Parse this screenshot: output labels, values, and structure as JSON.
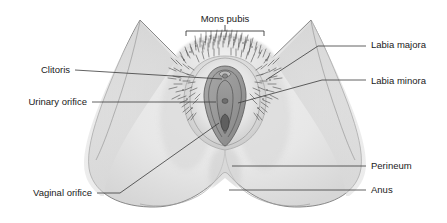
{
  "figure": {
    "background_color": "#ffffff",
    "line_color": "#3a3a3a",
    "body_fill": "#e8e8e8",
    "body_shadow": "#d2d2d2",
    "labia_majora_fill": "#dcdcdc",
    "labia_minora_fill": "#9a9a9a",
    "vestibule_fill": "#8c8c8c",
    "hair_color": "#4a4a4a"
  },
  "labels": {
    "mons_pubis": {
      "text": "Mons pubis",
      "x": 225,
      "y": 22,
      "anchor": "middle",
      "side": "top"
    },
    "labia_majora": {
      "text": "Labia majora",
      "x": 371,
      "y": 48,
      "anchor": "start",
      "side": "right"
    },
    "labia_minora": {
      "text": "Labia minora",
      "x": 371,
      "y": 82,
      "anchor": "start",
      "side": "right"
    },
    "perineum": {
      "text": "Perineum",
      "x": 371,
      "y": 168,
      "anchor": "start",
      "side": "right"
    },
    "anus": {
      "text": "Anus",
      "x": 371,
      "y": 192,
      "anchor": "start",
      "side": "right"
    },
    "clitoris": {
      "text": "Clitoris",
      "x": 70,
      "y": 72,
      "anchor": "end",
      "side": "left"
    },
    "urinary_orifice": {
      "text": "Urinary orifice",
      "x": 87,
      "y": 104,
      "anchor": "end",
      "side": "left"
    },
    "vaginal_orifice": {
      "text": "Vaginal orifice",
      "x": 92,
      "y": 195,
      "anchor": "end",
      "side": "left"
    }
  },
  "bracket": {
    "left_x": 186,
    "right_x": 264,
    "y": 31,
    "tick_x": 225,
    "tick_top": 25,
    "arm_drop": 5
  },
  "leaders": [
    {
      "name": "labia-majora-leader",
      "points": "366,46 318,46 266,80"
    },
    {
      "name": "labia-minora-leader",
      "points": "366,80 322,80 238,103"
    },
    {
      "name": "perineum-leader",
      "points": "366,166 232,166"
    },
    {
      "name": "anus-leader",
      "points": "366,190 229,190"
    },
    {
      "name": "clitoris-leader",
      "points": "75,70 222,79"
    },
    {
      "name": "urinary-orifice-leader",
      "points": "92,102 216,102"
    },
    {
      "name": "vaginal-orifice-leader",
      "points": "97,193 120,193 219,123"
    }
  ]
}
